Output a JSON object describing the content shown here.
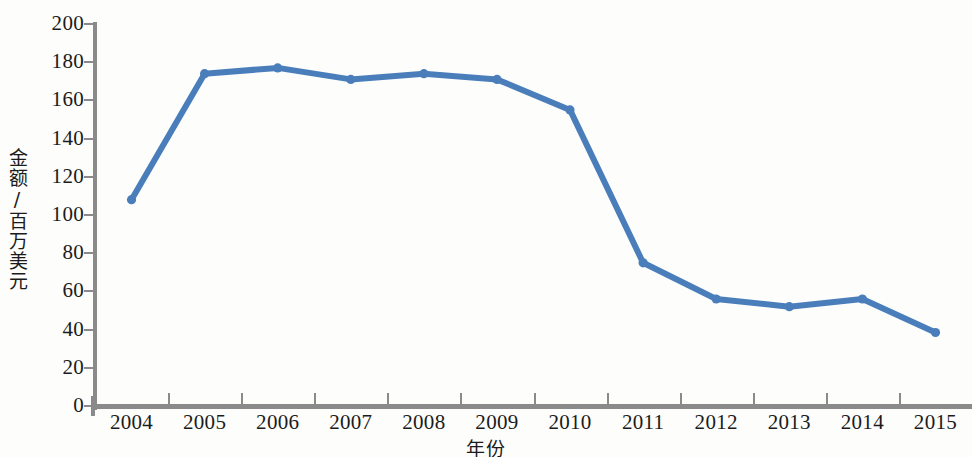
{
  "chart_data": {
    "type": "line",
    "title": "",
    "xlabel": "年份",
    "ylabel": "金额/百万美元",
    "categories": [
      "2004",
      "2005",
      "2006",
      "2007",
      "2008",
      "2009",
      "2010",
      "2011",
      "2012",
      "2013",
      "2014",
      "2015"
    ],
    "values": [
      108,
      174,
      177,
      171,
      174,
      171,
      155,
      75,
      56,
      52,
      56,
      38.5
    ],
    "series": [
      {
        "name": "金额",
        "color": "#4a7ebb",
        "values": [
          108,
          174,
          177,
          171,
          174,
          171,
          155,
          75,
          56,
          52,
          56,
          38.5
        ]
      }
    ],
    "ylim": [
      0,
      200
    ],
    "ytick_labels": [
      "0",
      "20",
      "40",
      "60",
      "80",
      "100",
      "120",
      "140",
      "160",
      "180",
      "200"
    ],
    "ytick_values": [
      0,
      20,
      40,
      60,
      80,
      100,
      120,
      140,
      160,
      180,
      200
    ],
    "grid": false,
    "legend": "none",
    "markers": "round",
    "line_color": "#4a7ebb",
    "axis_color": "#8a8a8a",
    "text_color": "#1b1b1b"
  }
}
